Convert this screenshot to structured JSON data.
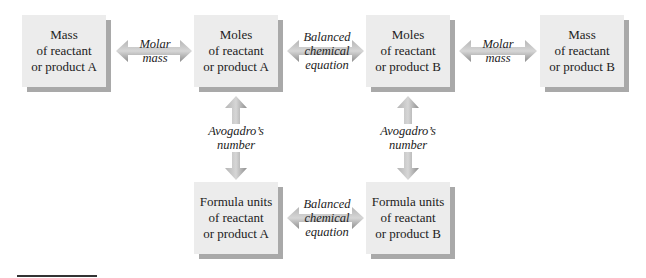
{
  "diagram": {
    "boxes": [
      {
        "id": "mass-a",
        "lines": [
          "Mass",
          "of reactant",
          "or product A"
        ]
      },
      {
        "id": "moles-a",
        "lines": [
          "Moles",
          "of reactant",
          "or product A"
        ]
      },
      {
        "id": "moles-b",
        "lines": [
          "Moles",
          "of reactant",
          "or product B"
        ]
      },
      {
        "id": "mass-b",
        "lines": [
          "Mass",
          "of reactant",
          "or product B"
        ]
      },
      {
        "id": "formula-a",
        "lines": [
          "Formula units",
          "of reactant",
          "or product A"
        ]
      },
      {
        "id": "formula-b",
        "lines": [
          "Formula units",
          "of reactant",
          "or product B"
        ]
      }
    ],
    "connectors": [
      {
        "from": "mass-a",
        "to": "moles-a",
        "lines": [
          "Molar",
          "mass"
        ]
      },
      {
        "from": "moles-a",
        "to": "moles-b",
        "lines": [
          "Balanced",
          "chemical",
          "equation"
        ]
      },
      {
        "from": "moles-b",
        "to": "mass-b",
        "lines": [
          "Molar",
          "mass"
        ]
      },
      {
        "from": "moles-a",
        "to": "formula-a",
        "lines": [
          "Avogadro’s",
          "number"
        ]
      },
      {
        "from": "moles-b",
        "to": "formula-b",
        "lines": [
          "Avogadro’s",
          "number"
        ]
      },
      {
        "from": "formula-a",
        "to": "formula-b",
        "lines": [
          "Balanced",
          "chemical",
          "equation"
        ]
      }
    ],
    "colors": {
      "box_fill": "#ececec",
      "box_shadow": "#a9a9a9",
      "arrow": "#9a9a9a",
      "arrow_highlight": "#c8c8c8"
    }
  }
}
